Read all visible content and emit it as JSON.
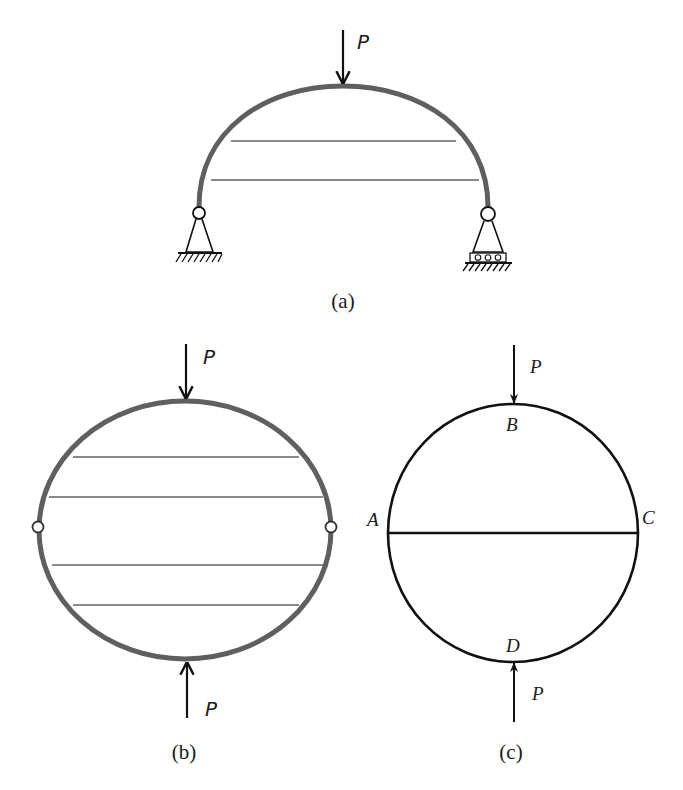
{
  "figures": {
    "a": {
      "caption": "(a)",
      "load_label": "P",
      "description": "Semicircular arch with two horizontal ties, pin support left, roller support right, point load P at crown"
    },
    "b": {
      "caption": "(b)",
      "top_load_label": "P",
      "bottom_load_label": "P",
      "description": "Closed elliptical ring with four horizontal ties, hinges at left and right, compressed by opposite loads P"
    },
    "c": {
      "caption": "(c)",
      "top_load_label": "P",
      "bottom_load_label": "P",
      "points": {
        "A": "A",
        "B": "B",
        "C": "C",
        "D": "D"
      },
      "description": "Circular ring with horizontal diameter AC, loads P at B (top) and D (bottom)"
    }
  },
  "colors": {
    "thick_member": "#5f5f5f",
    "tie": "#8a8a8a",
    "line": "#111111"
  }
}
